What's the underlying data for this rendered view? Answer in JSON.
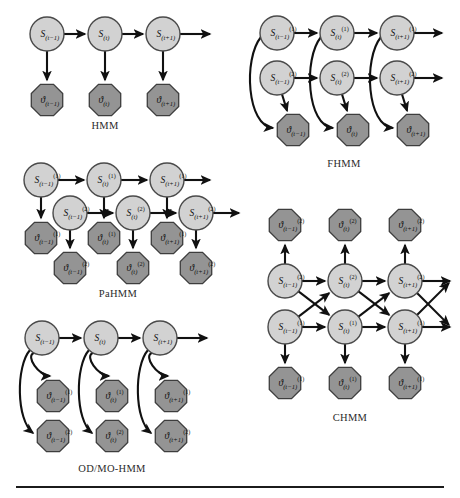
{
  "figure": {
    "background": "#ffffff",
    "width": 460,
    "height": 498,
    "colors": {
      "state_fill": "#d2d2d2",
      "state_stroke": "#4a4a4a",
      "obs_fill": "#949494",
      "obs_stroke": "#3d3d3d",
      "arrow": "#111111",
      "text": "#1a1a1a",
      "rule": "#1b1b1b"
    },
    "rule": {
      "visible": true,
      "x": 16,
      "y": 486,
      "width": 428
    }
  },
  "panels": [
    {
      "id": "hmm",
      "caption": "HMM",
      "caption_x": 105,
      "caption_y": 120,
      "states": [
        {
          "label": "S",
          "sub": "(t−1)",
          "sup": "",
          "cx": 47,
          "cy": 34
        },
        {
          "label": "S",
          "sub": "(t)",
          "sup": "",
          "cx": 105,
          "cy": 34
        },
        {
          "label": "S",
          "sub": "(t+1)",
          "sup": "",
          "cx": 163,
          "cy": 34
        }
      ],
      "observations": [
        {
          "label": "ϑ",
          "sub": "(t−1)",
          "sup": "",
          "cx": 47,
          "cy": 100
        },
        {
          "label": "ϑ",
          "sub": "(t)",
          "sup": "",
          "cx": 105,
          "cy": 100
        },
        {
          "label": "ϑ",
          "sub": "(t+1)",
          "sup": "",
          "cx": 163,
          "cy": 100
        }
      ]
    },
    {
      "id": "fhmm",
      "caption": "FHMM",
      "caption_x": 344,
      "caption_y": 158,
      "states": [
        {
          "label": "S",
          "sub": "(t−1)",
          "sup": "(1)",
          "cx": 277,
          "cy": 33
        },
        {
          "label": "S",
          "sub": "(t)",
          "sup": "(1)",
          "cx": 337,
          "cy": 33
        },
        {
          "label": "S",
          "sub": "(t+1)",
          "sup": "(1)",
          "cx": 397,
          "cy": 33
        },
        {
          "label": "S",
          "sub": "(t−1)",
          "sup": "(2)",
          "cx": 277,
          "cy": 78
        },
        {
          "label": "S",
          "sub": "(t)",
          "sup": "(2)",
          "cx": 337,
          "cy": 78
        },
        {
          "label": "S",
          "sub": "(t+1)",
          "sup": "(2)",
          "cx": 397,
          "cy": 78
        }
      ],
      "observations": [
        {
          "label": "ϑ",
          "sub": "(t−1)",
          "sup": "",
          "cx": 293,
          "cy": 130
        },
        {
          "label": "ϑ",
          "sub": "(t)",
          "sup": "",
          "cx": 353,
          "cy": 130
        },
        {
          "label": "ϑ",
          "sub": "(t+1)",
          "sup": "",
          "cx": 413,
          "cy": 130
        }
      ]
    },
    {
      "id": "pahmm",
      "caption": "PaHMM",
      "caption_x": 118,
      "caption_y": 288,
      "states": [
        {
          "label": "S",
          "sub": "(t−1)",
          "sup": "(1)",
          "cx": 41,
          "cy": 180
        },
        {
          "label": "S",
          "sub": "(t)",
          "sup": "(1)",
          "cx": 104,
          "cy": 180
        },
        {
          "label": "S",
          "sub": "(t+1)",
          "sup": "(1)",
          "cx": 167,
          "cy": 180
        },
        {
          "label": "S",
          "sub": "(t−1)",
          "sup": "(2)",
          "cx": 70,
          "cy": 213
        },
        {
          "label": "S",
          "sub": "(t)",
          "sup": "(2)",
          "cx": 133,
          "cy": 213
        },
        {
          "label": "S",
          "sub": "(t+1)",
          "sup": "(2)",
          "cx": 196,
          "cy": 213
        }
      ],
      "observations": [
        {
          "label": "ϑ",
          "sub": "(t−1)",
          "sup": "(1)",
          "cx": 41,
          "cy": 238
        },
        {
          "label": "ϑ",
          "sub": "(t)",
          "sup": "(1)",
          "cx": 104,
          "cy": 238
        },
        {
          "label": "ϑ",
          "sub": "(t+1)",
          "sup": "(1)",
          "cx": 167,
          "cy": 238
        },
        {
          "label": "ϑ",
          "sub": "(t−1)",
          "sup": "(2)",
          "cx": 70,
          "cy": 268
        },
        {
          "label": "ϑ",
          "sub": "(t)",
          "sup": "(2)",
          "cx": 133,
          "cy": 268
        },
        {
          "label": "ϑ",
          "sub": "(t+1)",
          "sup": "(2)",
          "cx": 196,
          "cy": 268
        }
      ]
    },
    {
      "id": "odmohmm",
      "caption": "OD/MO-HMM",
      "caption_x": 112,
      "caption_y": 463,
      "states": [
        {
          "label": "S",
          "sub": "(t−1)",
          "sup": "",
          "cx": 42,
          "cy": 338
        },
        {
          "label": "S",
          "sub": "(t)",
          "sup": "",
          "cx": 101,
          "cy": 338
        },
        {
          "label": "S",
          "sub": "(t+1)",
          "sup": "",
          "cx": 160,
          "cy": 338
        }
      ],
      "observations": [
        {
          "label": "ϑ",
          "sub": "(t−1)",
          "sup": "(1)",
          "cx": 53,
          "cy": 396
        },
        {
          "label": "ϑ",
          "sub": "(t)",
          "sup": "(1)",
          "cx": 112,
          "cy": 396
        },
        {
          "label": "ϑ",
          "sub": "(t+1)",
          "sup": "(1)",
          "cx": 171,
          "cy": 396
        },
        {
          "label": "ϑ",
          "sub": "(t−1)",
          "sup": "(2)",
          "cx": 53,
          "cy": 436
        },
        {
          "label": "ϑ",
          "sub": "(t)",
          "sup": "(2)",
          "cx": 112,
          "cy": 436
        },
        {
          "label": "ϑ",
          "sub": "(t+1)",
          "sup": "(2)",
          "cx": 171,
          "cy": 436
        }
      ]
    },
    {
      "id": "chmm",
      "caption": "CHMM",
      "caption_x": 350,
      "caption_y": 412,
      "states": [
        {
          "label": "S",
          "sub": "(t−1)",
          "sup": "(2)",
          "cx": 285,
          "cy": 281
        },
        {
          "label": "S",
          "sub": "(t)",
          "sup": "(2)",
          "cx": 345,
          "cy": 281
        },
        {
          "label": "S",
          "sub": "(t+1)",
          "sup": "(2)",
          "cx": 405,
          "cy": 281
        },
        {
          "label": "S",
          "sub": "(t−1)",
          "sup": "(1)",
          "cx": 285,
          "cy": 327
        },
        {
          "label": "S",
          "sub": "(t)",
          "sup": "(1)",
          "cx": 345,
          "cy": 327
        },
        {
          "label": "S",
          "sub": "(t+1)",
          "sup": "(1)",
          "cx": 405,
          "cy": 327
        }
      ],
      "observations": [
        {
          "label": "ϑ",
          "sub": "(t−1)",
          "sup": "(2)",
          "cx": 285,
          "cy": 225
        },
        {
          "label": "ϑ",
          "sub": "(t)",
          "sup": "(2)",
          "cx": 345,
          "cy": 225
        },
        {
          "label": "ϑ",
          "sub": "(t+1)",
          "sup": "(2)",
          "cx": 405,
          "cy": 225
        },
        {
          "label": "ϑ",
          "sub": "(t−1)",
          "sup": "(1)",
          "cx": 285,
          "cy": 383
        },
        {
          "label": "ϑ",
          "sub": "(t)",
          "sup": "(1)",
          "cx": 345,
          "cy": 383
        },
        {
          "label": "ϑ",
          "sub": "(t+1)",
          "sup": "(1)",
          "cx": 405,
          "cy": 383
        }
      ]
    }
  ]
}
